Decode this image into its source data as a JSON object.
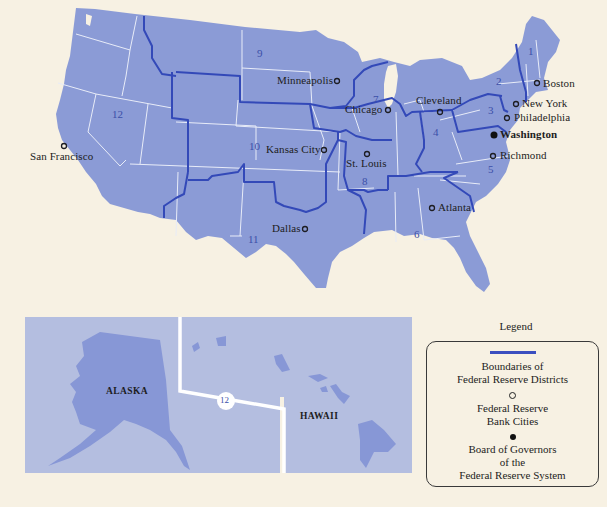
{
  "map": {
    "colors": {
      "background": "#f7f1e3",
      "land": "#8b9bd6",
      "inset_background": "#b4bee0",
      "inset_land": "#8797d6",
      "district_boundary": "#3349b8",
      "state_boundary": "#e8ecf8",
      "text": "#1d1d22",
      "district_number": "#3b4fa8"
    },
    "districts": [
      {
        "number": "1",
        "x": 528,
        "y": 46
      },
      {
        "number": "2",
        "x": 496,
        "y": 76
      },
      {
        "number": "3",
        "x": 488,
        "y": 105
      },
      {
        "number": "4",
        "x": 435,
        "y": 126
      },
      {
        "number": "5",
        "x": 488,
        "y": 166
      },
      {
        "number": "6",
        "x": 414,
        "y": 228
      },
      {
        "number": "7",
        "x": 372,
        "y": 94
      },
      {
        "number": "8",
        "x": 362,
        "y": 177
      },
      {
        "number": "9",
        "x": 257,
        "y": 50
      },
      {
        "number": "10",
        "x": 248,
        "y": 143
      },
      {
        "number": "11",
        "x": 248,
        "y": 234
      },
      {
        "number": "12",
        "x": 113,
        "y": 110
      }
    ],
    "cities": [
      {
        "name": "Boston",
        "x": 537,
        "y": 84,
        "label_x": 543,
        "label_y": 78,
        "type": "bank"
      },
      {
        "name": "New York",
        "x": 516,
        "y": 104,
        "label_x": 522,
        "label_y": 98,
        "type": "bank"
      },
      {
        "name": "Philadelphia",
        "x": 506,
        "y": 118,
        "label_x": 514,
        "label_y": 112,
        "type": "bank"
      },
      {
        "name": "Washington",
        "x": 494,
        "y": 135,
        "label_x": 500,
        "label_y": 129,
        "type": "board",
        "bold": true
      },
      {
        "name": "Richmond",
        "x": 493,
        "y": 156,
        "label_x": 500,
        "label_y": 150,
        "type": "bank"
      },
      {
        "name": "Cleveland",
        "x": 440,
        "y": 112,
        "label_x": 416,
        "label_y": 94,
        "type": "bank"
      },
      {
        "name": "Chicago",
        "x": 388,
        "y": 110,
        "label_x": 345,
        "label_y": 104,
        "type": "bank"
      },
      {
        "name": "Minneapolis",
        "x": 337,
        "y": 81,
        "label_x": 277,
        "label_y": 75,
        "type": "bank"
      },
      {
        "name": "Kansas City",
        "x": 324,
        "y": 150,
        "label_x": 266,
        "label_y": 144,
        "type": "bank"
      },
      {
        "name": "St. Louis",
        "x": 367,
        "y": 154,
        "label_x": 346,
        "label_y": 158,
        "type": "bank"
      },
      {
        "name": "Atlanta",
        "x": 432,
        "y": 208,
        "label_x": 438,
        "label_y": 202,
        "type": "bank"
      },
      {
        "name": "Dallas",
        "x": 305,
        "y": 229,
        "label_x": 272,
        "label_y": 223,
        "type": "bank"
      },
      {
        "name": "San Francisco",
        "x": 64,
        "y": 146,
        "label_x": 30,
        "label_y": 151,
        "type": "bank"
      }
    ],
    "insets": {
      "alaska": {
        "label": "ALASKA",
        "x": 106,
        "y": 386
      },
      "hawaii": {
        "label": "HAWAII",
        "x": 300,
        "y": 410
      },
      "district_badge": "12"
    }
  },
  "legend": {
    "title": "Legend",
    "items": [
      {
        "symbol": "boundary-line",
        "lines": [
          "Boundaries of",
          "Federal Reserve Districts"
        ]
      },
      {
        "symbol": "open-circle",
        "lines": [
          "Federal Reserve",
          "Bank Cities"
        ]
      },
      {
        "symbol": "solid-circle",
        "lines": [
          "Board of Governors",
          "of the",
          "Federal Reserve System"
        ]
      }
    ]
  }
}
